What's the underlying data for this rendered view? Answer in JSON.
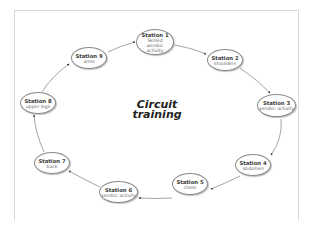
{
  "diagram": {
    "title_line1": "Circuit",
    "title_line2": "training",
    "stations": [
      {
        "title": "Station 1",
        "subtitle": "Skilled aerobic activity",
        "cx": 155,
        "cy": 42,
        "w": 38,
        "h": 25
      },
      {
        "title": "Station 2",
        "subtitle": "shoulders",
        "cx": 225,
        "cy": 60,
        "w": 36,
        "h": 22
      },
      {
        "title": "Station 3",
        "subtitle": "aerobic activity",
        "cx": 276,
        "cy": 106,
        "w": 38,
        "h": 23
      },
      {
        "title": "Station 4",
        "subtitle": "abdomen",
        "cx": 253,
        "cy": 165,
        "w": 36,
        "h": 22
      },
      {
        "title": "Station 5",
        "subtitle": "chest",
        "cx": 190,
        "cy": 184,
        "w": 36,
        "h": 22
      },
      {
        "title": "Station 6",
        "subtitle": "aerobic activity",
        "cx": 118,
        "cy": 192,
        "w": 38,
        "h": 22
      },
      {
        "title": "Station 7",
        "subtitle": "back",
        "cx": 52,
        "cy": 163,
        "w": 36,
        "h": 22
      },
      {
        "title": "Station 8",
        "subtitle": "upper legs",
        "cx": 38,
        "cy": 103,
        "w": 36,
        "h": 22
      },
      {
        "title": "Station 9",
        "subtitle": "arms",
        "cx": 89,
        "cy": 58,
        "w": 36,
        "h": 22
      }
    ],
    "edges": [
      {
        "from": 9,
        "to": 1
      },
      {
        "from": 1,
        "to": 2
      },
      {
        "from": 2,
        "to": 3
      },
      {
        "from": 3,
        "to": 4
      },
      {
        "from": 4,
        "to": 5
      },
      {
        "from": 5,
        "to": 6
      },
      {
        "from": 6,
        "to": 7
      },
      {
        "from": 7,
        "to": 8
      },
      {
        "from": 8,
        "to": 9
      }
    ],
    "colors": {
      "line": "#555555",
      "node_border": "#8a8a8a",
      "frame": "#d8d8d8"
    }
  }
}
